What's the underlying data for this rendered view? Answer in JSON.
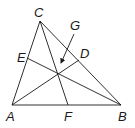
{
  "diagram": {
    "type": "triangle-cevians",
    "points": {
      "A": {
        "label": "A",
        "x": 12,
        "y": 105
      },
      "B": {
        "label": "B",
        "x": 121,
        "y": 105
      },
      "C": {
        "label": "C",
        "x": 40,
        "y": 21
      },
      "D": {
        "label": "D",
        "x": 79,
        "y": 60
      },
      "E": {
        "label": "E",
        "x": 27,
        "y": 58
      },
      "F": {
        "label": "F",
        "x": 68,
        "y": 105
      },
      "G": {
        "label": "G",
        "x": 57,
        "y": 73
      }
    },
    "segments": [
      "AB",
      "BC",
      "CA",
      "AD",
      "BE",
      "CF"
    ],
    "annotation": {
      "label": "G",
      "arrow_from": [
        74,
        34
      ],
      "arrow_to": [
        60,
        65
      ]
    }
  }
}
